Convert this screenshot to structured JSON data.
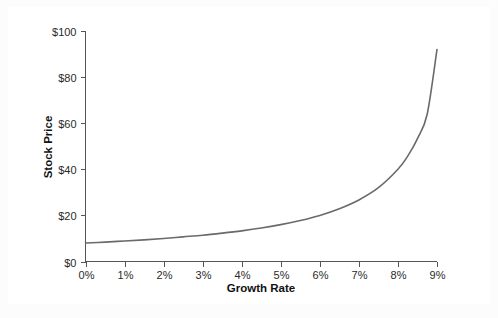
{
  "chart_data": {
    "type": "line",
    "title": "",
    "subtitle": "",
    "xlabel": "Growth Rate",
    "ylabel": "Stock Price",
    "xlim": [
      0,
      9
    ],
    "ylim": [
      0,
      100
    ],
    "grid": false,
    "legend": null,
    "legend_position": "none",
    "x_tick_labels": [
      "0%",
      "1%",
      "2%",
      "3%",
      "4%",
      "5%",
      "6%",
      "7%",
      "8%",
      "9%"
    ],
    "x_tick_values": [
      0,
      1,
      2,
      3,
      4,
      5,
      6,
      7,
      8,
      9
    ],
    "y_tick_labels": [
      "$0",
      "$20",
      "$40",
      "$60",
      "$80",
      "$100"
    ],
    "y_tick_values": [
      0,
      20,
      40,
      60,
      80,
      100
    ],
    "series": [
      {
        "name": "Stock Price",
        "color": "#6a6a6a",
        "x": [
          0,
          0.5,
          1,
          1.5,
          2,
          2.5,
          3,
          3.5,
          4,
          4.5,
          5,
          5.5,
          6,
          6.5,
          7,
          7.5,
          8,
          8.25,
          8.5,
          8.75,
          9
        ],
        "values": [
          8.0,
          8.4,
          8.9,
          9.4,
          10.0,
          10.7,
          11.4,
          12.3,
          13.3,
          14.5,
          16.0,
          17.8,
          20.0,
          22.9,
          26.7,
          32.0,
          40.0,
          45.7,
          53.3,
          64.0,
          92.0
        ]
      }
    ],
    "annotations": []
  },
  "axes": {
    "y_axis_label": "Stock Price",
    "x_axis_label": "Growth Rate"
  },
  "style": {
    "background": "#ffffff",
    "page_background": "#fcfcfc",
    "axis_color": "#555555",
    "text_color": "#2a2a2a",
    "line_color": "#6a6a6a"
  }
}
